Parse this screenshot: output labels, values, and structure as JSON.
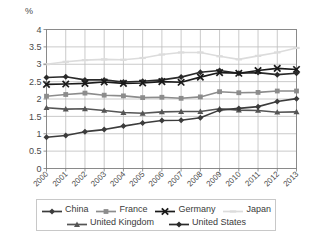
{
  "chart_data": {
    "type": "line",
    "title": "",
    "subtitle": "",
    "xlabel": "",
    "ylabel": "%",
    "unit_label": "%",
    "grid": true,
    "legend_position": "bottom",
    "ylim": [
      0,
      4
    ],
    "ytick_labels": [
      "0",
      "0.5",
      "1",
      "1.5",
      "2",
      "2.5",
      "3",
      "3.5",
      "4"
    ],
    "ytick_values": [
      0,
      0.5,
      1,
      1.5,
      2,
      2.5,
      3,
      3.5,
      4
    ],
    "categories": [
      "2000",
      "2001",
      "2002",
      "2003",
      "2004",
      "2005",
      "2006",
      "2007",
      "2008",
      "2009",
      "2010",
      "2011",
      "2012",
      "2013"
    ],
    "x": [
      2000,
      2001,
      2002,
      2003,
      2004,
      2005,
      2006,
      2007,
      2008,
      2009,
      2010,
      2011,
      2012,
      2013
    ],
    "series": [
      {
        "name": "China",
        "color": "#3c3c3c",
        "marker": "diamond",
        "values": [
          0.9,
          0.95,
          1.06,
          1.12,
          1.22,
          1.31,
          1.38,
          1.39,
          1.46,
          1.68,
          1.73,
          1.78,
          1.93,
          2.01
        ]
      },
      {
        "name": "France",
        "color": "#8c8c8c",
        "marker": "square",
        "values": [
          2.08,
          2.13,
          2.17,
          2.11,
          2.09,
          2.04,
          2.05,
          2.02,
          2.06,
          2.21,
          2.18,
          2.19,
          2.23,
          2.23
        ]
      },
      {
        "name": "Germany",
        "color": "#1a1a1a",
        "marker": "cross",
        "values": [
          2.42,
          2.43,
          2.45,
          2.49,
          2.45,
          2.46,
          2.5,
          2.48,
          2.63,
          2.76,
          2.74,
          2.82,
          2.88,
          2.85
        ]
      },
      {
        "name": "Japan",
        "color": "#dcdcdc",
        "marker": "dash",
        "values": [
          3.0,
          3.07,
          3.12,
          3.14,
          3.13,
          3.18,
          3.28,
          3.34,
          3.34,
          3.23,
          3.14,
          3.24,
          3.34,
          3.47
        ]
      },
      {
        "name": "United Kingdom",
        "color": "#555555",
        "marker": "triangle",
        "values": [
          1.75,
          1.71,
          1.72,
          1.67,
          1.61,
          1.59,
          1.63,
          1.64,
          1.64,
          1.72,
          1.68,
          1.67,
          1.62,
          1.63
        ]
      },
      {
        "name": "United States",
        "color": "#2a2a2a",
        "marker": "diamond",
        "values": [
          2.62,
          2.64,
          2.55,
          2.55,
          2.49,
          2.51,
          2.55,
          2.63,
          2.77,
          2.82,
          2.74,
          2.76,
          2.7,
          2.74
        ]
      }
    ]
  },
  "legend": {
    "items": [
      {
        "label": "China"
      },
      {
        "label": "France"
      },
      {
        "label": "Germany"
      },
      {
        "label": "Japan"
      },
      {
        "label": "United Kingdom"
      },
      {
        "label": "United States"
      }
    ]
  }
}
